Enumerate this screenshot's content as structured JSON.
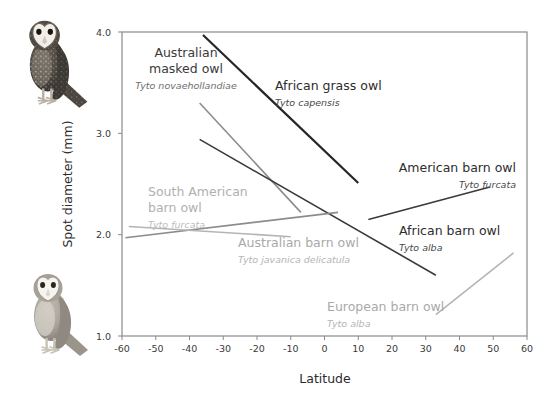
{
  "figure": {
    "background": "#ffffff",
    "plot_border_color": "#8a8a8a"
  },
  "axes": {
    "x": {
      "title": "Latitude",
      "min": -60,
      "max": 60,
      "ticks": [
        "-60",
        "-50",
        "-40",
        "-30",
        "-20",
        "-10",
        "0",
        "10",
        "20",
        "30",
        "40",
        "50",
        "60"
      ],
      "tick_values": [
        -60,
        -50,
        -40,
        -30,
        -20,
        -10,
        0,
        10,
        20,
        30,
        40,
        50,
        60
      ]
    },
    "y": {
      "title": "Spot diameter (mm)",
      "min": 1.0,
      "max": 4.0,
      "ticks": [
        "1.0",
        "2.0",
        "3.0",
        "4.0"
      ],
      "tick_values": [
        1.0,
        2.0,
        3.0,
        4.0
      ]
    }
  },
  "illustrations": [
    {
      "name": "owl-dark-spotted",
      "position": "top-left",
      "description": "dark heavily spotted barn owl"
    },
    {
      "name": "owl-pale-plain",
      "position": "bottom-left",
      "description": "pale lightly spotted barn owl"
    }
  ],
  "chart_data": {
    "type": "line",
    "title": "",
    "xlabel": "Latitude",
    "ylabel": "Spot diameter (mm)",
    "xlim": [
      -60,
      60
    ],
    "ylim": [
      1.0,
      4.0
    ],
    "grid": false,
    "legend": "inline-annotations",
    "series": [
      {
        "name": "African grass owl",
        "latin": "Tyto capensis",
        "color": "#262626",
        "width": 2.2,
        "x": [
          -36,
          10
        ],
        "y": [
          3.97,
          2.51
        ]
      },
      {
        "name": "Australian masked owl",
        "latin": "Tyto novaehollandiae",
        "color": "#8c8c8c",
        "width": 1.6,
        "x": [
          -37,
          -7
        ],
        "y": [
          3.3,
          2.22
        ]
      },
      {
        "name": "African barn owl",
        "latin": "Tyto alba",
        "color": "#3a3a3a",
        "width": 1.6,
        "x": [
          -37,
          33
        ],
        "y": [
          2.94,
          1.6
        ]
      },
      {
        "name": "American barn owl",
        "latin": "Tyto furcata",
        "color": "#3a3a3a",
        "width": 1.6,
        "x": [
          13,
          49
        ],
        "y": [
          2.15,
          2.47
        ]
      },
      {
        "name": "South American barn owl",
        "latin": "Tyto furcata",
        "color": "#8c8c8c",
        "width": 1.6,
        "x": [
          -59,
          4
        ],
        "y": [
          1.97,
          2.22
        ]
      },
      {
        "name": "Australian barn owl",
        "latin": "Tyto javanica delicatula",
        "color": "#b4b4b4",
        "width": 1.6,
        "x": [
          -58,
          -10
        ],
        "y": [
          2.08,
          1.98
        ]
      },
      {
        "name": "European barn owl",
        "latin": "Tyto alba",
        "color": "#b4b4b4",
        "width": 1.6,
        "x": [
          33,
          56
        ],
        "y": [
          1.21,
          1.82
        ]
      }
    ],
    "annotations": [
      {
        "id": "ann-australian-masked-owl",
        "common": "Australian masked owl",
        "latin": "Tyto novaehollandiae",
        "color": "#3a3a3a",
        "latin_color": "#6e6e6e",
        "lines": [
          "Australian",
          "masked owl"
        ],
        "anchor_x": 186,
        "anchor_y": 57,
        "align": "middle"
      },
      {
        "id": "ann-african-grass-owl",
        "common": "African grass owl",
        "latin": "Tyto capensis",
        "color": "#2d2d2d",
        "latin_color": "#4a4a4a",
        "lines": [
          "African grass owl"
        ],
        "anchor_x": 275,
        "anchor_y": 90,
        "align": "start"
      },
      {
        "id": "ann-american-barn-owl",
        "common": "American barn owl",
        "latin": "Tyto furcata",
        "color": "#2d2d2d",
        "latin_color": "#4a4a4a",
        "lines": [
          "American barn owl"
        ],
        "anchor_x": 516,
        "anchor_y": 172,
        "align": "end"
      },
      {
        "id": "ann-south-american-barn-owl",
        "common": "South American barn owl",
        "latin": "Tyto furcata",
        "color": "#b0b0b0",
        "latin_color": "#bdbdbd",
        "lines": [
          "South American",
          "barn owl"
        ],
        "anchor_x": 148,
        "anchor_y": 196,
        "align": "start"
      },
      {
        "id": "ann-african-barn-owl",
        "common": "African barn owl",
        "latin": "Tyto alba",
        "color": "#2d2d2d",
        "latin_color": "#4a4a4a",
        "lines": [
          "African barn owl"
        ],
        "anchor_x": 399,
        "anchor_y": 235,
        "align": "start"
      },
      {
        "id": "ann-australian-barn-owl",
        "common": "Australian barn owl",
        "latin": "Tyto javanica delicatula",
        "color": "#a9a9a9",
        "latin_color": "#b5b5b5",
        "lines": [
          "Australian barn owl"
        ],
        "anchor_x": 238,
        "anchor_y": 247,
        "align": "start"
      },
      {
        "id": "ann-european-barn-owl",
        "common": "European barn owl",
        "latin": "Tyto alba",
        "color": "#a9a9a9",
        "latin_color": "#b5b5b5",
        "lines": [
          "European barn owl"
        ],
        "anchor_x": 327,
        "anchor_y": 311,
        "align": "start"
      }
    ]
  }
}
